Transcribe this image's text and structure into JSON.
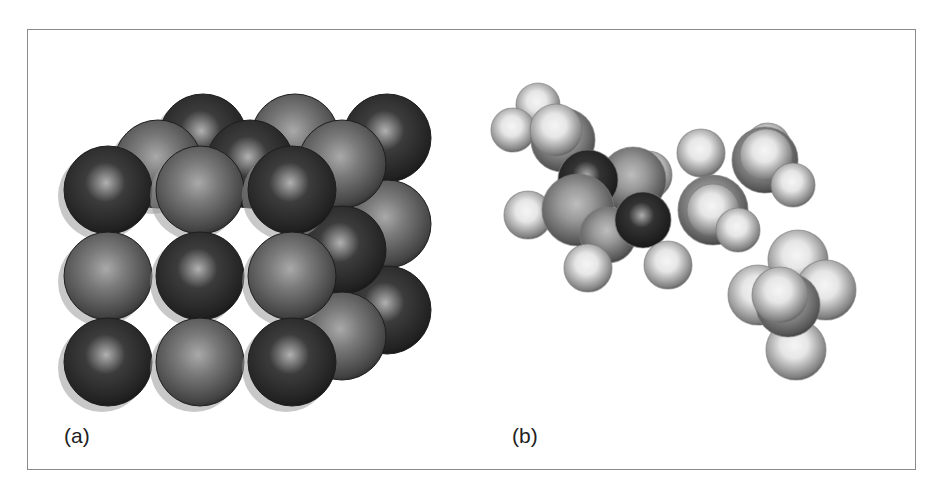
{
  "figure": {
    "panels": [
      {
        "id": "a",
        "label": "(a)",
        "description": "Space-filling model of an ionic crystal lattice (3x3x3 cube of alternating dark and light spheres)",
        "colors": {
          "dark_ion": "#3c3c3c",
          "light_ion": "#7a7a7a"
        }
      },
      {
        "id": "b",
        "label": "(b)",
        "description": "Space-filling model of a molecule with light hydrogen-like atoms, mid-grey carbon-like atoms and dark heteroatoms",
        "colors": {
          "light_atom": "#e6e6e6",
          "mid_atom": "#9a9a9a",
          "dark_atom": "#333333"
        }
      }
    ]
  }
}
